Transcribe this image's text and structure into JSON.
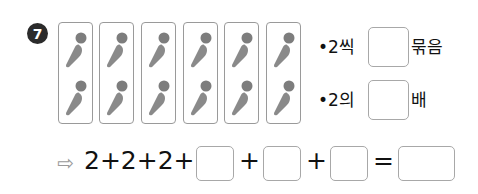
{
  "problem": {
    "number": "7",
    "cards": [
      {
        "items": [
          "carrot",
          "carrot"
        ]
      },
      {
        "items": [
          "carrot",
          "carrot"
        ]
      },
      {
        "items": [
          "carrot",
          "carrot"
        ]
      },
      {
        "items": [
          "carrot",
          "carrot"
        ]
      },
      {
        "items": [
          "carrot",
          "carrot"
        ]
      },
      {
        "items": [
          "carrot",
          "carrot"
        ]
      }
    ],
    "statements": [
      {
        "bullet": "•",
        "prefix": "2씩",
        "suffix": "묶음",
        "answer": ""
      },
      {
        "bullet": "•",
        "prefix": "2의",
        "suffix": "배",
        "answer": ""
      }
    ],
    "equation": {
      "arrow": "⇨",
      "prefix": "2+2+2+",
      "plus": "+",
      "equals": "=",
      "blanks": [
        "",
        "",
        "",
        ""
      ]
    }
  },
  "colors": {
    "carrot": "#8a8a8a",
    "carrot_leaf": "#7a7a7a",
    "border": "#a8a8a8",
    "badge": "#2b2b2b"
  }
}
